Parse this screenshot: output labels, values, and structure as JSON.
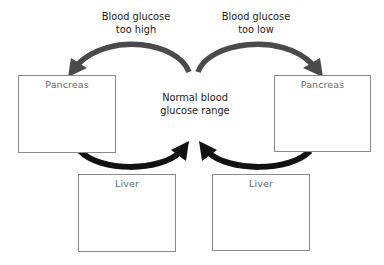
{
  "diagram": {
    "center_label": {
      "line1": "Normal blood",
      "line2": "glucose range"
    },
    "top_left_label": {
      "line1": "Blood glucose",
      "line2": "too high"
    },
    "top_right_label": {
      "line1": "Blood glucose",
      "line2": "too low"
    },
    "boxes": {
      "pancreas_left": {
        "title": "Pancreas"
      },
      "pancreas_right": {
        "title": "Pancreas"
      },
      "liver_left": {
        "title": "Liver"
      },
      "liver_right": {
        "title": "Liver"
      }
    },
    "colors": {
      "top_arrow": "#4a4a4a",
      "bottom_arrow": "#111111",
      "box_border": "#8a8a8a",
      "box_title": "#6a6a6a",
      "label_text": "#1a1a1a"
    }
  }
}
